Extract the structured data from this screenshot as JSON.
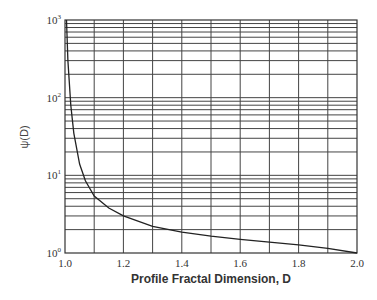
{
  "chart_data": {
    "type": "line",
    "title": "",
    "xlabel": "Profile Fractal Dimension, D",
    "ylabel": "ψ(D)",
    "xscale": "linear",
    "yscale": "log",
    "xlim": [
      1.0,
      2.0
    ],
    "ylim": [
      1,
      1000
    ],
    "grid": true,
    "x_ticks": [
      "1.0",
      "1.2",
      "1.4",
      "1.6",
      "1.8",
      "2.0"
    ],
    "y_ticks": [
      {
        "base": "10",
        "exp": "0"
      },
      {
        "base": "10",
        "exp": "1"
      },
      {
        "base": "10",
        "exp": "2"
      },
      {
        "base": "10",
        "exp": "3"
      }
    ],
    "series": [
      {
        "name": "ψ(D)",
        "x": [
          1.005,
          1.01,
          1.02,
          1.03,
          1.05,
          1.07,
          1.1,
          1.15,
          1.2,
          1.3,
          1.4,
          1.5,
          1.6,
          1.7,
          1.8,
          1.9,
          2.0
        ],
        "values": [
          1000,
          300,
          80,
          35,
          14,
          8.5,
          5.4,
          3.8,
          3.0,
          2.2,
          1.85,
          1.65,
          1.5,
          1.38,
          1.27,
          1.15,
          1.0
        ]
      }
    ],
    "legend": null
  }
}
